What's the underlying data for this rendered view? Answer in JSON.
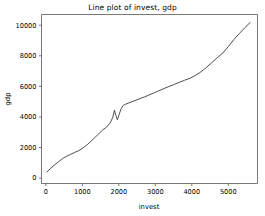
{
  "figure": {
    "background_color": "#ffffff",
    "width": 265,
    "height": 216
  },
  "chart_data": {
    "type": "line",
    "title": "Line plot of invest, gdp",
    "xlabel": "invest",
    "ylabel": "gdp",
    "xlim": [
      -120,
      5800
    ],
    "ylim": [
      -350,
      10700
    ],
    "xticks": [
      0,
      1000,
      2000,
      3000,
      4000,
      5000
    ],
    "xticklabels": [
      "0",
      "1000",
      "2000",
      "3000",
      "4000",
      "5000"
    ],
    "yticks": [
      0,
      2000,
      4000,
      6000,
      8000,
      10000
    ],
    "yticklabels": [
      "0",
      "2000",
      "4000",
      "6000",
      "8000",
      "10000"
    ],
    "grid": false,
    "legend": false,
    "line_color": "#3a3a3a",
    "line_width": 0.9,
    "series": [
      {
        "name": "gdp",
        "x": [
          30,
          120,
          230,
          340,
          450,
          560,
          680,
          790,
          900,
          1010,
          1120,
          1230,
          1340,
          1450,
          1560,
          1670,
          1760,
          1830,
          1880,
          1920,
          1960,
          2010,
          2060,
          2120,
          2180,
          2260,
          2360,
          2470,
          2580,
          2700,
          2820,
          2950,
          3080,
          3210,
          3350,
          3500,
          3650,
          3800,
          3950,
          4100,
          4250,
          4400,
          4550,
          4700,
          4850,
          5000,
          5150,
          5300,
          5450,
          5600
        ],
        "y": [
          400,
          620,
          850,
          1060,
          1270,
          1420,
          1560,
          1680,
          1800,
          1960,
          2160,
          2400,
          2650,
          2900,
          3160,
          3350,
          3600,
          3950,
          4450,
          4080,
          3820,
          4180,
          4530,
          4760,
          4830,
          4900,
          5000,
          5100,
          5200,
          5310,
          5430,
          5560,
          5700,
          5830,
          5970,
          6110,
          6260,
          6400,
          6530,
          6720,
          6950,
          7240,
          7560,
          7880,
          8180,
          8600,
          9050,
          9450,
          9830,
          10180
        ]
      }
    ]
  }
}
